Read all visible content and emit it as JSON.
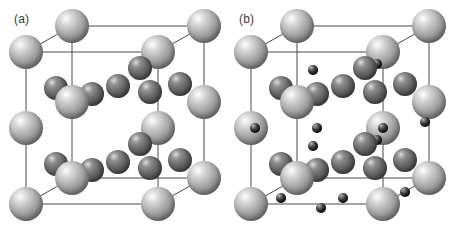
{
  "figure": {
    "background_color": "#ffffff",
    "projection": "oblique",
    "panels": [
      {
        "id": "a",
        "label": "(a)",
        "atom_types": [
          {
            "key": "a",
            "role": "large-light-sphere",
            "color": "#9a9a9a",
            "radius_px": 17
          },
          {
            "key": "b",
            "role": "medium-dark-sphere",
            "color": "#5a5a5a",
            "radius_px": 12
          }
        ],
        "frame": {
          "line_color": "#4a4a4a",
          "line_width": 1,
          "front": {
            "x": 26,
            "y": 52,
            "w": 132,
            "h": 152
          },
          "depth": {
            "dx": 46,
            "dy": -26
          }
        },
        "atoms": [
          {
            "t": "a",
            "x": 26,
            "y": 52
          },
          {
            "t": "a",
            "x": 158,
            "y": 52
          },
          {
            "t": "a",
            "x": 26,
            "y": 128
          },
          {
            "t": "a",
            "x": 158,
            "y": 128
          },
          {
            "t": "a",
            "x": 26,
            "y": 204
          },
          {
            "t": "a",
            "x": 158,
            "y": 204
          },
          {
            "t": "a",
            "x": 72,
            "y": 26
          },
          {
            "t": "a",
            "x": 204,
            "y": 26
          },
          {
            "t": "a",
            "x": 72,
            "y": 102
          },
          {
            "t": "a",
            "x": 204,
            "y": 102
          },
          {
            "t": "a",
            "x": 72,
            "y": 178
          },
          {
            "t": "a",
            "x": 204,
            "y": 178
          },
          {
            "t": "b",
            "x": 56,
            "y": 88
          },
          {
            "t": "b",
            "x": 92,
            "y": 94
          },
          {
            "t": "b",
            "x": 118,
            "y": 86
          },
          {
            "t": "b",
            "x": 150,
            "y": 92
          },
          {
            "t": "b",
            "x": 180,
            "y": 84
          },
          {
            "t": "b",
            "x": 140,
            "y": 68
          },
          {
            "t": "b",
            "x": 56,
            "y": 164
          },
          {
            "t": "b",
            "x": 92,
            "y": 170
          },
          {
            "t": "b",
            "x": 118,
            "y": 162
          },
          {
            "t": "b",
            "x": 150,
            "y": 168
          },
          {
            "t": "b",
            "x": 180,
            "y": 160
          },
          {
            "t": "b",
            "x": 140,
            "y": 144
          }
        ]
      },
      {
        "id": "b",
        "label": "(b)",
        "atom_types": [
          {
            "key": "a",
            "role": "large-light-sphere",
            "color": "#9a9a9a",
            "radius_px": 17
          },
          {
            "key": "b",
            "role": "medium-dark-sphere",
            "color": "#5a5a5a",
            "radius_px": 12
          },
          {
            "key": "c",
            "role": "small-black-sphere",
            "color": "#1c1c1c",
            "radius_px": 5
          }
        ],
        "frame": {
          "line_color": "#4a4a4a",
          "line_width": 1,
          "front": {
            "x": 26,
            "y": 52,
            "w": 132,
            "h": 152
          },
          "depth": {
            "dx": 46,
            "dy": -26
          }
        },
        "atoms": [
          {
            "t": "a",
            "x": 26,
            "y": 52
          },
          {
            "t": "a",
            "x": 158,
            "y": 52
          },
          {
            "t": "a",
            "x": 26,
            "y": 128
          },
          {
            "t": "a",
            "x": 158,
            "y": 128
          },
          {
            "t": "a",
            "x": 26,
            "y": 204
          },
          {
            "t": "a",
            "x": 158,
            "y": 204
          },
          {
            "t": "a",
            "x": 72,
            "y": 26
          },
          {
            "t": "a",
            "x": 204,
            "y": 26
          },
          {
            "t": "a",
            "x": 72,
            "y": 102
          },
          {
            "t": "a",
            "x": 204,
            "y": 102
          },
          {
            "t": "a",
            "x": 72,
            "y": 178
          },
          {
            "t": "a",
            "x": 204,
            "y": 178
          },
          {
            "t": "b",
            "x": 56,
            "y": 88
          },
          {
            "t": "b",
            "x": 92,
            "y": 94
          },
          {
            "t": "b",
            "x": 118,
            "y": 86
          },
          {
            "t": "b",
            "x": 150,
            "y": 92
          },
          {
            "t": "b",
            "x": 180,
            "y": 84
          },
          {
            "t": "b",
            "x": 140,
            "y": 68
          },
          {
            "t": "b",
            "x": 56,
            "y": 164
          },
          {
            "t": "b",
            "x": 92,
            "y": 170
          },
          {
            "t": "b",
            "x": 118,
            "y": 162
          },
          {
            "t": "b",
            "x": 150,
            "y": 168
          },
          {
            "t": "b",
            "x": 180,
            "y": 160
          },
          {
            "t": "b",
            "x": 140,
            "y": 144
          },
          {
            "t": "c",
            "x": 88,
            "y": 70
          },
          {
            "t": "c",
            "x": 152,
            "y": 64
          },
          {
            "t": "c",
            "x": 30,
            "y": 128
          },
          {
            "t": "c",
            "x": 92,
            "y": 128
          },
          {
            "t": "c",
            "x": 158,
            "y": 128
          },
          {
            "t": "c",
            "x": 200,
            "y": 122
          },
          {
            "t": "c",
            "x": 88,
            "y": 146
          },
          {
            "t": "c",
            "x": 152,
            "y": 140
          },
          {
            "t": "c",
            "x": 56,
            "y": 198
          },
          {
            "t": "c",
            "x": 118,
            "y": 198
          },
          {
            "t": "c",
            "x": 180,
            "y": 192
          },
          {
            "t": "c",
            "x": 96,
            "y": 208
          }
        ]
      }
    ]
  }
}
